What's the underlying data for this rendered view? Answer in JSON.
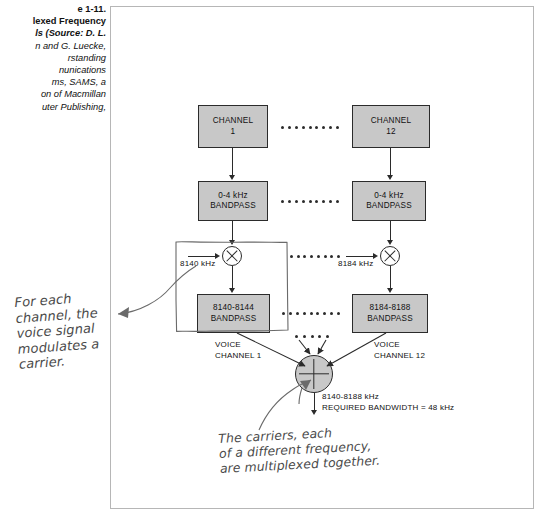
{
  "caption": {
    "lines": [
      "e 1-11.",
      "lexed Frequency",
      "ls (Source: D. L.",
      "n and G. Luecke,",
      "rstanding",
      "nunications",
      "ms, SAMS, a",
      "on of Macmillan",
      "uter Publishing,"
    ]
  },
  "diagram": {
    "channel1_box": {
      "line1": "CHANNEL",
      "line2": "1"
    },
    "channel12_box": {
      "line1": "CHANNEL",
      "line2": "12"
    },
    "bandpass1_box": {
      "line1": "0-4 kHz",
      "line2": "BANDPASS"
    },
    "bandpass12_box": {
      "line1": "0-4 kHz",
      "line2": "BANDPASS"
    },
    "carrier1_label": "8140 kHz",
    "carrier12_label": "8184 kHz",
    "rf_bandpass1_box": {
      "line1": "8140-8144",
      "line2": "BANDPASS"
    },
    "rf_bandpass12_box": {
      "line1": "8184-8188",
      "line2": "BANDPASS"
    },
    "voice_channel1_label": {
      "line1": "VOICE",
      "line2": "CHANNEL 1"
    },
    "voice_channel12_label": {
      "line1": "VOICE",
      "line2": "CHANNEL 12"
    },
    "output_label": {
      "line1": "8140-8188 kHz",
      "line2": "REQUIRED BANDWIDTH = 48 kHz"
    },
    "mixer_symbol": "multiply-circle",
    "summer_symbol": "plus-circle"
  },
  "annotations": {
    "note_left": [
      "For each",
      "channel, the",
      "voice signal",
      "modulates a",
      "carrier."
    ],
    "note_bottom": [
      "The carriers, each",
      "of a different frequency,",
      "are multiplexed together."
    ]
  },
  "colors": {
    "box_fill": "#c8c8c8",
    "stroke": "#2b2b2b",
    "frame_border": "#b6b6b6",
    "handwriting": "#4a4a4a"
  }
}
